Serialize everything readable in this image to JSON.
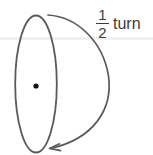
{
  "figure": {
    "background_color": "#ffffff",
    "stroke_color": "#555555",
    "text_color": "#3c3c3c",
    "guide_line_color": "#ededed"
  },
  "label": {
    "fraction_numerator": "1",
    "fraction_denominator": "2",
    "unit": "turn",
    "full_text": "1/2 turn"
  },
  "shapes": {
    "ellipse": {
      "name": "vertical-ellipse",
      "center_x": 36,
      "center_y": 84,
      "radius_x": 21,
      "radius_y": 69
    },
    "center_point": {
      "name": "center-dot",
      "x": 36,
      "y": 86,
      "radius": 2.6
    },
    "rotation_arc": {
      "name": "rotation-arrow",
      "start_x": 48,
      "start_y": 15,
      "end_x": 52,
      "end_y": 148,
      "bulge_x": 110,
      "direction": "clockwise-around-right",
      "arrowhead_at": "bottom-left"
    },
    "guide_line": {
      "name": "horizontal-guide",
      "y": 38,
      "x_start": 0,
      "x_end": 153
    }
  }
}
